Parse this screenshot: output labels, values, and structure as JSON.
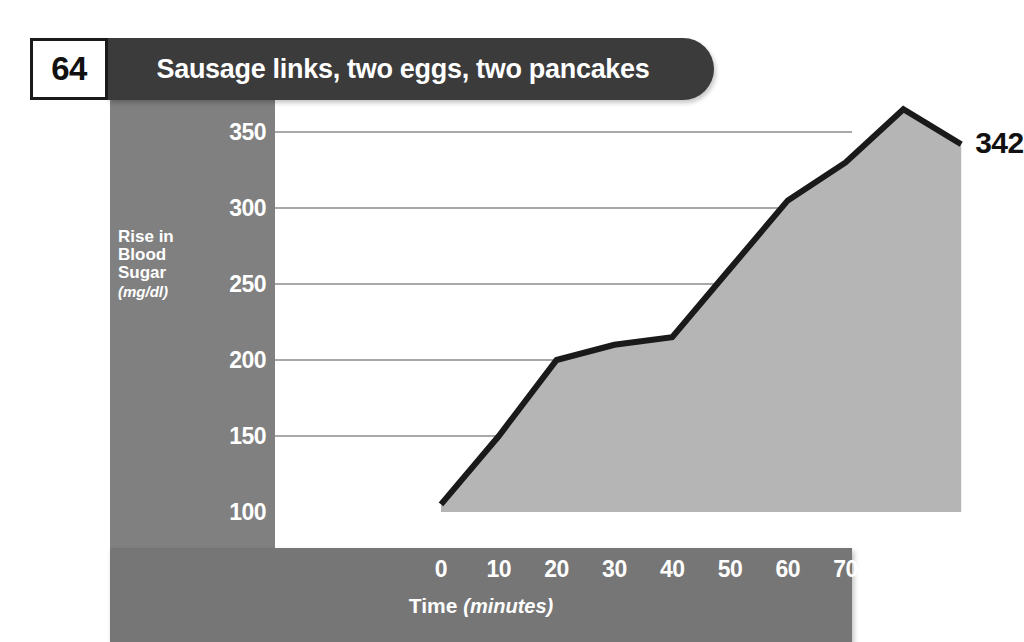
{
  "header": {
    "number": "64",
    "title": "Sausage links, two eggs, two  pancakes"
  },
  "chart_data": {
    "type": "area",
    "title": "Sausage links, two eggs, two  pancakes",
    "xlabel": "Time",
    "xlabel_units": "(minutes)",
    "ylabel": "Rise in Blood Sugar",
    "ylabel_units": "(mg/dl)",
    "xlim": [
      0,
      90
    ],
    "ylim": [
      100,
      365
    ],
    "grid": true,
    "legend": "none",
    "x": [
      0,
      10,
      20,
      30,
      40,
      50,
      60,
      70,
      80,
      90
    ],
    "values": [
      105,
      150,
      200,
      210,
      215,
      260,
      305,
      330,
      365,
      342
    ],
    "xticks": [
      "0",
      "10",
      "20",
      "30",
      "40",
      "50",
      "60",
      "70",
      "80",
      "90"
    ],
    "yticks": [
      "100",
      "150",
      "200",
      "250",
      "300",
      "350"
    ],
    "annotations": [
      {
        "label": "342",
        "x": 90,
        "y": 342
      }
    ]
  },
  "colors": {
    "title_bar": "#3b3b3b",
    "sidebar": "#808080",
    "axis_bar": "#767676",
    "area_fill": "#b5b5b5",
    "line": "#1a1a1a",
    "gridline": "#a8a8a8",
    "plot_background": "#ffffff"
  }
}
